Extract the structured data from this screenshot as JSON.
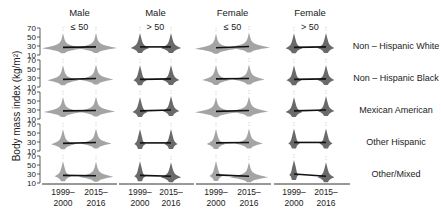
{
  "chart_data": {
    "type": "violin",
    "title": "",
    "ylabel": "Body mass index (kg/m²)",
    "xlabel": "",
    "ylim": [
      10,
      70
    ],
    "yticks": [
      10,
      30,
      50,
      70
    ],
    "x": [
      "1999–2000",
      "2015–2016"
    ],
    "xtick_lines": [
      [
        "1999–",
        "2000"
      ],
      [
        "2015–",
        "2016"
      ]
    ],
    "columns": [
      {
        "sex": "Male",
        "age": "≤ 50"
      },
      {
        "sex": "Male",
        "age": "> 50"
      },
      {
        "sex": "Female",
        "age": "≤ 50"
      },
      {
        "sex": "Female",
        "age": "> 50"
      }
    ],
    "rows": [
      "Non – Hispanic White",
      "Non – Hispanic Black",
      "Mexican American",
      "Other Hispanic",
      "Other/Mixed"
    ],
    "series": [
      {
        "row": "Non – Hispanic White",
        "median": [
          [
            27,
            28
          ],
          [
            28,
            28
          ],
          [
            26,
            29
          ],
          [
            27,
            28
          ]
        ],
        "width": [
          [
            1.0,
            1.0
          ],
          [
            0.35,
            0.4
          ],
          [
            1.0,
            1.0
          ],
          [
            0.3,
            0.3
          ]
        ]
      },
      {
        "row": "Non – Hispanic Black",
        "median": [
          [
            27,
            29
          ],
          [
            27,
            28
          ],
          [
            28,
            29
          ],
          [
            27,
            28
          ]
        ],
        "width": [
          [
            0.7,
            0.8
          ],
          [
            0.2,
            0.3
          ],
          [
            0.6,
            0.7
          ],
          [
            0.25,
            0.3
          ]
        ]
      },
      {
        "row": "Mexican American",
        "median": [
          [
            28,
            29
          ],
          [
            28,
            30
          ],
          [
            27,
            29
          ],
          [
            28,
            30
          ]
        ],
        "width": [
          [
            0.9,
            0.9
          ],
          [
            0.25,
            0.3
          ],
          [
            1.0,
            0.9
          ],
          [
            0.3,
            0.3
          ]
        ]
      },
      {
        "row": "Other Hispanic",
        "median": [
          [
            27,
            29
          ],
          [
            28,
            28
          ],
          [
            28,
            29
          ],
          [
            29,
            29
          ]
        ],
        "width": [
          [
            0.5,
            0.7
          ],
          [
            0.15,
            0.2
          ],
          [
            0.35,
            0.6
          ],
          [
            0.15,
            0.2
          ]
        ]
      },
      {
        "row": "Other/Mixed",
        "median": [
          [
            27,
            26
          ],
          [
            27,
            25
          ],
          [
            28,
            25
          ],
          [
            30,
            25
          ]
        ],
        "width": [
          [
            0.3,
            0.8
          ],
          [
            0.15,
            0.4
          ],
          [
            0.2,
            0.9
          ],
          [
            0.1,
            0.3
          ]
        ]
      }
    ],
    "colors": {
      "violin": "#9a9a9a",
      "violin_dark": "#5a5a5a",
      "line": "#111111",
      "axis": "#333333"
    },
    "grid": false,
    "legend": "none"
  }
}
